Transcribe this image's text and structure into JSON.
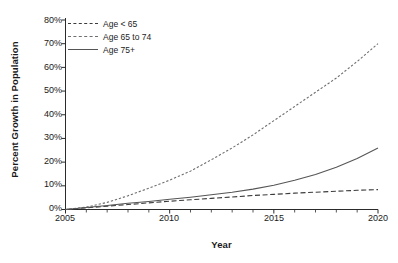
{
  "chart_data": {
    "type": "line",
    "title": "",
    "xlabel": "Year",
    "ylabel": "Percent Growth in Population",
    "xlim": [
      2005,
      2020
    ],
    "ylim": [
      0,
      80
    ],
    "grid": false,
    "legend_position": "top-left (inside axes)",
    "x": [
      2005,
      2006,
      2007,
      2008,
      2009,
      2010,
      2011,
      2012,
      2013,
      2014,
      2015,
      2016,
      2017,
      2018,
      2019,
      2020
    ],
    "xticks": [
      2005,
      2010,
      2015,
      2020
    ],
    "xtick_labels": [
      "2005",
      "2010",
      "2015",
      "2020"
    ],
    "x_minor_ticks": [
      2006,
      2007,
      2008,
      2009,
      2011,
      2012,
      2013,
      2014,
      2016,
      2017,
      2018,
      2019
    ],
    "yticks": [
      0,
      10,
      20,
      30,
      40,
      50,
      60,
      70,
      80
    ],
    "ytick_labels": [
      "0%",
      "10%",
      "20%",
      "30%",
      "40%",
      "50%",
      "60%",
      "70%",
      "80%"
    ],
    "series": [
      {
        "name": "Age < 65",
        "style": "dashed",
        "color": "#3b3b3b",
        "values": [
          0.0,
          0.7,
          1.4,
          2.1,
          2.8,
          3.5,
          4.1,
          4.7,
          5.3,
          5.9,
          6.4,
          6.9,
          7.3,
          7.7,
          8.1,
          8.4
        ]
      },
      {
        "name": "Age 65 to 74",
        "style": "dotted",
        "color": "#6e6e6e",
        "values": [
          0.0,
          1.0,
          3.0,
          5.8,
          9.0,
          12.4,
          16.2,
          21.0,
          26.0,
          31.5,
          37.5,
          43.5,
          49.5,
          55.5,
          62.5,
          70.0
        ]
      },
      {
        "name": "Age 75+",
        "style": "solid",
        "color": "#555555",
        "values": [
          0.0,
          0.8,
          1.7,
          2.6,
          3.4,
          4.3,
          5.2,
          6.2,
          7.3,
          8.6,
          10.2,
          12.3,
          14.8,
          17.8,
          21.5,
          26.0
        ]
      }
    ]
  },
  "axes": {
    "ytick_labels": [
      "80%",
      "70%",
      "60%",
      "50%",
      "40%",
      "30%",
      "20%",
      "10%",
      "0%"
    ],
    "xtick_labels": [
      "2005",
      "2010",
      "2015",
      "2020"
    ],
    "xlabel": "Year",
    "ylabel": "Percent Growth in Population"
  },
  "legend": {
    "items": [
      {
        "label": "Age < 65"
      },
      {
        "label": "Age 65 to 74"
      },
      {
        "label": "Age 75+"
      }
    ]
  }
}
